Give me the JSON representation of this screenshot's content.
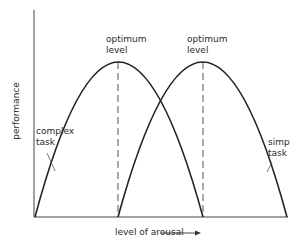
{
  "diagram": {
    "y_axis_label": "performance",
    "x_axis_label": "level of arousal",
    "curves": [
      {
        "id": "complex",
        "label_line1": "complex",
        "label_line2": "task"
      },
      {
        "id": "simple",
        "label_line1": "simp",
        "label_line2": "task"
      }
    ],
    "peaks": [
      {
        "label_line1": "optimum",
        "label_line2": "level"
      },
      {
        "label_line1": "optimum",
        "label_line2": "level"
      }
    ],
    "colors": {
      "line": "#222222",
      "dashed": "#555555",
      "text": "#2a2a2a",
      "leader": "#555555"
    }
  }
}
